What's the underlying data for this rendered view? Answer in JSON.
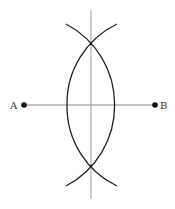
{
  "diagram": {
    "points": {
      "A": {
        "label": "A",
        "x": 24,
        "y": 105
      },
      "B": {
        "label": "B",
        "x": 155,
        "y": 105
      }
    },
    "intersections": {
      "top": {
        "x": 91,
        "y": 44
      },
      "bottom": {
        "x": 91,
        "y": 166
      }
    },
    "colors": {
      "arc": "#222222",
      "segment": "#888888",
      "bisector": "#999999",
      "point": "#111111",
      "label": "#333333"
    }
  }
}
